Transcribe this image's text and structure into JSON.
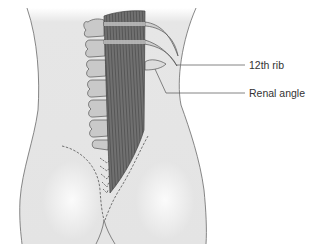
{
  "figure": {
    "labels": [
      {
        "id": "twelfth-rib",
        "text": "12th rib",
        "x": 249,
        "y": 60
      },
      {
        "id": "renal-angle",
        "text": "Renal angle",
        "x": 249,
        "y": 88
      }
    ],
    "colors": {
      "skin": "#e4e4e4",
      "skin_highlight": "#f7f7f7",
      "outline": "#6a6a6a",
      "muscle": "#6e6e6e",
      "muscle_fiber": "#4e4e4e",
      "bone": "#c8c8c8",
      "bone_outline": "#5a5a5a",
      "rib": "#cfcfcf",
      "leader_line": "#666666",
      "text": "#333333"
    },
    "structures": [
      "body-outline",
      "vertebral-column",
      "erector-spinae-muscle",
      "ribs",
      "kidney-outline",
      "gluteal-dashed-lines",
      "sacral-chevrons"
    ]
  }
}
